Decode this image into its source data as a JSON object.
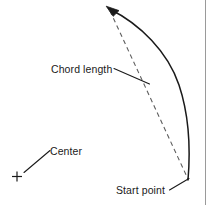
{
  "figure": {
    "background_color": "#ffffff",
    "stroke_color": "#1a1a1a",
    "border_color": "#9a9a9a",
    "width": 212,
    "height": 205
  },
  "labels": {
    "chord_length": "Chord length",
    "center": "Center",
    "start_point": "Start point"
  },
  "icons": {
    "center_marker": "plus-marker-icon",
    "arc_arrowhead": "arrowhead-icon"
  },
  "geometry": {
    "arc": {
      "description": "solid curved arc with arrowhead at upper end",
      "start": [
        188,
        180
      ],
      "end": [
        107,
        7
      ],
      "bulge_point": [
        190,
        112
      ],
      "style": "solid"
    },
    "chord": {
      "description": "dashed straight line connecting the arc endpoints",
      "from": [
        109,
        10
      ],
      "to": [
        188,
        179
      ],
      "style": "dashed"
    },
    "center_marker": {
      "position": [
        17,
        176
      ],
      "style": "cross"
    },
    "leaders": [
      {
        "name": "chord-length-leader",
        "from": [
          115,
          69
        ],
        "to": [
          149,
          84
        ]
      },
      {
        "name": "center-leader",
        "from": [
          50,
          150
        ],
        "to": [
          24,
          172
        ]
      },
      {
        "name": "start-point-leader",
        "from": [
          170,
          190
        ],
        "to": [
          189,
          178
        ]
      }
    ],
    "right_border": {
      "x": 205,
      "from_y": 0,
      "to_y": 205
    }
  }
}
